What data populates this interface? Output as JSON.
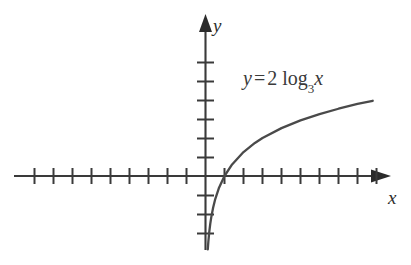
{
  "figure": {
    "background_color": "#ffffff",
    "stroke_color": "#4a4a4a",
    "axis_color": "#3a3a3a",
    "text_color": "#2e2e2e"
  },
  "labels": {
    "y_axis": "y",
    "x_axis": "x",
    "equation": {
      "lhs": "y",
      "equals": "=",
      "coefficient": "2",
      "function": "log",
      "base": "3",
      "argument": "x",
      "full_text": "y = 2 log₃x"
    }
  },
  "chart_data": {
    "type": "line",
    "xlabel": "x",
    "ylabel": "y",
    "grid": false,
    "legend": false,
    "legend_position": "none",
    "annotations": [
      {
        "text": "y = 2 log₃x",
        "x": 2.0,
        "y": 5.4
      }
    ],
    "axes": {
      "x_axis": {
        "ticks_left_of_origin": 9,
        "ticks_right_of_origin": 9,
        "tick_spacing_units": 1,
        "arrow_direction": "right",
        "range_visible": [
          -10.5,
          9.5
        ]
      },
      "y_axis": {
        "ticks_above_origin": 6,
        "ticks_below_origin": 3,
        "tick_spacing_units": 1,
        "arrow_direction": "up",
        "range_visible": [
          -4.5,
          7.5
        ]
      }
    },
    "series": [
      {
        "name": "y = 2 log₃x",
        "equation": "y = 2 * log_3(x)",
        "x": [
          0.12,
          0.15,
          0.2,
          0.25,
          0.3,
          0.4,
          0.5,
          0.7,
          1.0,
          1.4,
          2.0,
          2.6,
          3.0,
          4.0,
          5.0,
          6.0,
          7.0,
          8.0,
          8.8
        ],
        "y": [
          -3.86,
          -3.45,
          -2.93,
          -2.52,
          -2.19,
          -1.67,
          -1.26,
          -0.65,
          0.0,
          0.61,
          1.26,
          1.74,
          2.0,
          2.52,
          2.93,
          3.26,
          3.54,
          3.79,
          3.96
        ]
      }
    ]
  }
}
